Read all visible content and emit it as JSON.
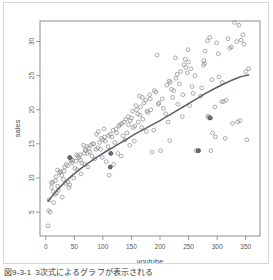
{
  "figure": {
    "caption_number": "図9-3-1",
    "caption_text": "3次式によるグラフが表示される"
  },
  "chart_data": {
    "type": "scatter",
    "title": "",
    "xlabel": "youtube",
    "ylabel": "sales",
    "xlim": [
      -10,
      375
    ],
    "ylim": [
      1.5,
      33
    ],
    "xticks": [
      0,
      50,
      100,
      150,
      200,
      250,
      300,
      350
    ],
    "yticks": [
      5,
      10,
      15,
      20,
      25,
      30
    ],
    "grid": false,
    "legend": null,
    "marker": "open-circle",
    "marker_color": "#8f8f96",
    "line_color": "#5b5f6b",
    "series": [
      {
        "name": "observations",
        "x": [
          276.1,
          53.4,
          20.6,
          181.8,
          217.0,
          10.4,
          69.0,
          144.2,
          10.0,
          240.0,
          44.0,
          230.0,
          70.0,
          166.0,
          276.8,
          165.0,
          156.0,
          218.0,
          56.0,
          287.0,
          254.0,
          5.0,
          12.0,
          172.0,
          103.0,
          283.0,
          248.0,
          18.0,
          152.0,
          130.0,
          190.0,
          311.0,
          286.0,
          299.0,
          26.0,
          67.0,
          75.0,
          220.0,
          36.0,
          100.0,
          183.0,
          197.0,
          45.0,
          94.0,
          137.0,
          79.0,
          110.0,
          250.0,
          33.0,
          159.0,
          24.0,
          228.0,
          242.0,
          338.0,
          212.0,
          123.0,
          60.0,
          195.0,
          289.0,
          140.0,
          4.0,
          14.0,
          17.0,
          22.0,
          28.0,
          31.0,
          38.0,
          42.0,
          47.0,
          51.0,
          58.0,
          63.0,
          72.0,
          77.0,
          84.0,
          88.0,
          92.0,
          97.0,
          106.0,
          113.0,
          118.0,
          126.0,
          133.0,
          142.0,
          148.0,
          155.0,
          161.0,
          168.0,
          175.0,
          179.0,
          186.0,
          193.0,
          201.0,
          206.0,
          214.0,
          222.0,
          227.0,
          234.0,
          239.0,
          245.0,
          252.0,
          258.0,
          263.0,
          268.0,
          273.0,
          279.0,
          285.0,
          292.0,
          297.0,
          303.0,
          308.0,
          314.0,
          319.0,
          325.0,
          330.0,
          336.0,
          342.0,
          347.0,
          352.0,
          355.0,
          8.0,
          16.0,
          21.0,
          29.0,
          35.0,
          41.0,
          49.0,
          55.0,
          62.0,
          68.0,
          74.0,
          81.0,
          86.0,
          91.0,
          99.0,
          104.0,
          109.0,
          116.0,
          121.0,
          128.0,
          135.0,
          145.0,
          150.0,
          158.0,
          164.0,
          170.0,
          177.0,
          184.0,
          189.0,
          198.0,
          204.0,
          210.0,
          216.0,
          224.0,
          231.0,
          236.0,
          244.0,
          249.0,
          256.0,
          261.0,
          266.0,
          271.0,
          278.0,
          284.0,
          291.0,
          296.0,
          302.0,
          309.0,
          316.0,
          322.0,
          327.0,
          334.0,
          340.0,
          345.0,
          350.0,
          6.0,
          13.0,
          19.0,
          25.0,
          32.0,
          39.0,
          46.0,
          54.0,
          61.0,
          66.0,
          73.0,
          82.0,
          89.0,
          96.0,
          102.0,
          111.0,
          119.0,
          124.0,
          132.0,
          139.0,
          147.0,
          153.0,
          162.0,
          169.0,
          176.0
        ],
        "y": [
          26.52,
          12.48,
          11.16,
          22.2,
          15.48,
          8.64,
          14.16,
          19.0,
          9.3,
          22.2,
          12.5,
          25.2,
          14.0,
          20.4,
          27.2,
          19.2,
          17.6,
          24.0,
          13.2,
          30.6,
          26.0,
          5.2,
          9.4,
          21.0,
          16.0,
          30.1,
          25.4,
          10.2,
          19.8,
          17.8,
          22.8,
          21.2,
          18.8,
          29.8,
          11.0,
          13.6,
          14.4,
          23.0,
          12.0,
          15.6,
          21.6,
          20.8,
          12.8,
          15.2,
          18.2,
          14.8,
          16.2,
          27.0,
          11.6,
          20.0,
          10.8,
          24.6,
          26.6,
          32.4,
          23.6,
          17.2,
          13.4,
          28.0,
          14.0,
          18.6,
          3.0,
          6.4,
          9.6,
          8.2,
          10.4,
          9.8,
          11.8,
          9.0,
          12.6,
          11.4,
          13.0,
          12.2,
          14.6,
          13.8,
          15.0,
          14.2,
          16.8,
          15.8,
          12.4,
          16.4,
          17.0,
          13.6,
          18.0,
          16.6,
          18.4,
          15.4,
          19.4,
          17.4,
          21.4,
          19.6,
          13.8,
          22.6,
          14.0,
          20.2,
          18.2,
          21.8,
          27.6,
          23.8,
          19.0,
          26.2,
          20.6,
          22.4,
          14.0,
          14.0,
          23.2,
          28.6,
          19.0,
          16.6,
          16.0,
          24.8,
          21.2,
          15.8,
          30.4,
          29.2,
          32.8,
          18.2,
          30.2,
          29.6,
          15.6,
          26.0,
          5.0,
          7.6,
          8.8,
          7.2,
          9.2,
          8.6,
          10.0,
          11.2,
          10.6,
          12.0,
          11.6,
          13.2,
          12.8,
          14.4,
          13.0,
          15.4,
          14.6,
          16.0,
          15.2,
          17.6,
          16.2,
          17.8,
          18.8,
          20.6,
          22.0,
          18.6,
          19.8,
          20.0,
          17.0,
          21.0,
          21.6,
          19.4,
          24.2,
          22.8,
          20.8,
          25.6,
          27.4,
          28.8,
          23.4,
          25.0,
          14.0,
          22.0,
          26.8,
          19.0,
          24.4,
          20.4,
          28.2,
          24.0,
          21.4,
          29.0,
          18.0,
          30.0,
          18.4,
          31.0,
          25.6,
          6.8,
          8.0,
          7.8,
          10.8,
          11.0,
          9.4,
          12.2,
          13.4,
          12.6,
          14.8,
          13.6,
          15.0,
          16.4,
          14.2,
          17.2,
          10.4,
          12.0,
          16.6,
          13.2,
          15.6,
          14.8,
          17.4,
          18.2,
          21.8,
          16.8
        ]
      },
      {
        "name": "highlighted-points",
        "x": [
          42.0,
          114.0,
          113.0,
          267.0,
          288.0
        ],
        "y": [
          13.0,
          13.6,
          11.6,
          14.0,
          18.8
        ]
      }
    ],
    "fit": {
      "name": "cubic-polynomial-fit",
      "color": "#5b5f6b",
      "x": [
        4,
        20,
        40,
        60,
        80,
        100,
        120,
        140,
        160,
        180,
        200,
        220,
        240,
        260,
        280,
        300,
        320,
        340,
        355
      ],
      "y": [
        6.6,
        8.2,
        9.9,
        11.3,
        12.5,
        13.6,
        14.6,
        15.6,
        16.6,
        17.5,
        18.4,
        19.4,
        20.4,
        21.4,
        22.4,
        23.3,
        24.1,
        24.8,
        25.1
      ]
    }
  }
}
